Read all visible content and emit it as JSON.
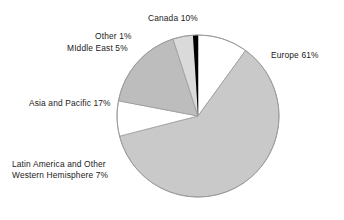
{
  "chart_data": {
    "type": "pie",
    "title": "",
    "subtitle": "",
    "xlabel": "",
    "ylabel": "",
    "legend_position": "none",
    "grid": false,
    "units": "percent",
    "start_angle_deg": 0,
    "direction": "clockwise",
    "center": {
      "x": 198,
      "y": 116
    },
    "radius": 81,
    "categories": [
      "Canada",
      "Europe",
      "Latin America and Other Western Hemisphere",
      "Asia and Pacific",
      "Middle East",
      "Other"
    ],
    "values": [
      10,
      61,
      7,
      17,
      5,
      1
    ],
    "slices": [
      {
        "name": "Canada",
        "value": 10,
        "value_text": "10%",
        "label_text": "Canada 10%",
        "color": "#ffffff",
        "start_deg": 0,
        "end_deg": 36
      },
      {
        "name": "Europe",
        "value": 61,
        "value_text": "61%",
        "label_text": "Europe 61%",
        "color": "#c9c9c9",
        "start_deg": 36,
        "end_deg": 255.6
      },
      {
        "name": "Latin America and Other Western Hemisphere",
        "value": 7,
        "value_text": "7%",
        "label_text_line1": "Latin America and Other",
        "label_text_line2": "Western Hemisphere 7%",
        "color": "#ffffff",
        "start_deg": 255.6,
        "end_deg": 280.8
      },
      {
        "name": "Asia and Pacific",
        "value": 17,
        "value_text": "17%",
        "label_text": "Asia and Pacific 17%",
        "color": "#bdbdbd",
        "start_deg": 280.8,
        "end_deg": 342
      },
      {
        "name": "Middle East",
        "value": 5,
        "value_text": "5%",
        "label_text": "MIddle East 5%",
        "color": "#dadada",
        "start_deg": 342,
        "end_deg": 360
      },
      {
        "name": "Other",
        "value": 1,
        "value_text": "1%",
        "label_text": "Other 1%",
        "color": "#000000",
        "start_deg": 356.4,
        "end_deg": 360
      }
    ],
    "outline_color": "#9a9a9a",
    "background_color": "#ffffff",
    "text_color": "#1a1a1a"
  },
  "labels": {
    "canada": "Canada 10%",
    "other": "Other 1%",
    "middle_east": "MIddle East 5%",
    "europe": "Europe 61%",
    "asia_pacific": "Asia and Pacific 17%",
    "latin_line1": "Latin America and Other",
    "latin_line2": "Western Hemisphere 7%"
  }
}
